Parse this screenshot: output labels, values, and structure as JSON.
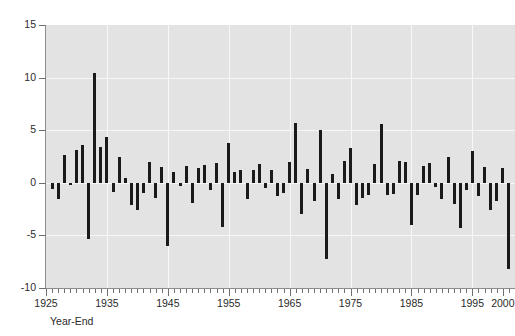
{
  "chart_data": {
    "type": "bar",
    "title": "",
    "subtitle": "",
    "xlabel": "Year-End",
    "ylabel": "",
    "xlim": [
      1925,
      2002
    ],
    "ylim": [
      -10,
      15
    ],
    "grid": true,
    "legend": "none",
    "y_ticks": [
      15,
      10,
      5,
      0,
      -5,
      -10
    ],
    "x_ticks_major": [
      1925,
      1935,
      1945,
      1955,
      1965,
      1975,
      1985,
      1995,
      2000
    ],
    "x_tick_interval": 1,
    "bar_color": "#1a1a1a",
    "plot_background": "#e3e3e3",
    "gridline_color": "#f7f7f7",
    "x": [
      1926,
      1927,
      1928,
      1929,
      1930,
      1931,
      1932,
      1933,
      1934,
      1935,
      1936,
      1937,
      1938,
      1939,
      1940,
      1941,
      1942,
      1943,
      1944,
      1945,
      1946,
      1947,
      1948,
      1949,
      1950,
      1951,
      1952,
      1953,
      1954,
      1955,
      1956,
      1957,
      1958,
      1959,
      1960,
      1961,
      1962,
      1963,
      1964,
      1965,
      1966,
      1967,
      1968,
      1969,
      1970,
      1971,
      1972,
      1973,
      1974,
      1975,
      1976,
      1977,
      1978,
      1979,
      1980,
      1981,
      1982,
      1983,
      1984,
      1985,
      1986,
      1987,
      1988,
      1989,
      1990,
      1991,
      1992,
      1993,
      1994,
      1995,
      1996,
      1997,
      1998,
      1999,
      2000,
      2001
    ],
    "values": [
      -0.6,
      -1.5,
      2.6,
      -0.2,
      3.1,
      3.6,
      -5.3,
      10.4,
      3.4,
      4.4,
      -0.9,
      2.5,
      0.5,
      -2.1,
      -2.6,
      -1.0,
      2.0,
      -1.4,
      1.5,
      -6.0,
      1.0,
      -0.3,
      1.6,
      -1.9,
      1.4,
      1.7,
      -0.7,
      1.9,
      -4.2,
      3.8,
      1.0,
      1.2,
      -1.5,
      1.2,
      1.8,
      -0.5,
      1.2,
      -1.3,
      -1.0,
      2.0,
      5.7,
      -3.0,
      1.3,
      -1.7,
      5.0,
      -7.2,
      0.8,
      -1.5,
      2.1,
      3.3,
      -2.1,
      -1.4,
      -1.2,
      1.8,
      5.6,
      -1.2,
      -1.1,
      2.1,
      2.0,
      -4.0,
      -1.2,
      1.6,
      1.9,
      -0.4,
      -1.5,
      2.5,
      -2.0,
      -4.3,
      -0.7,
      3.0,
      -1.3,
      1.5,
      -2.6,
      -1.7,
      1.4,
      -8.2
    ]
  },
  "axis": {
    "x_title": "Year-End",
    "y_title": ""
  }
}
